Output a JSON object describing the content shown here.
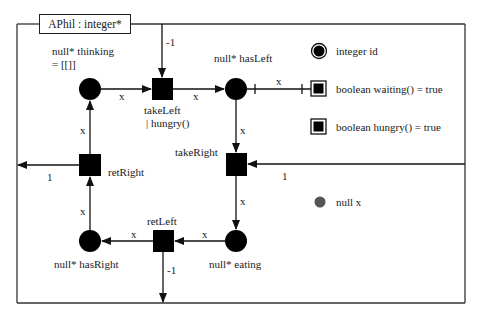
{
  "diagram": {
    "title": "APhil : integer*",
    "places": {
      "thinking": {
        "label": "null*  thinking",
        "marking": "= [[]]"
      },
      "hasLeft": {
        "label": "null*  hasLeft"
      },
      "eating": {
        "label": "null*  eating"
      },
      "hasRight": {
        "label": "null*  hasRight"
      }
    },
    "transitions": {
      "takeLeft": {
        "label": "takeLeft",
        "guard": "| hungry()"
      },
      "takeRight": {
        "label": "takeRight"
      },
      "retLeft": {
        "label": "retLeft"
      },
      "retRight": {
        "label": "retRight"
      }
    },
    "arcs": {
      "thinking_takeLeft": "x",
      "takeLeft_hasLeft": "x",
      "hasLeft_waiting": "x",
      "hasLeft_takeRight": "x",
      "takeRight_eating": "x",
      "eating_retLeft": "x",
      "retLeft_hasRight": "x",
      "hasRight_retRight": "x",
      "retRight_thinking": "x",
      "top_takeLeft": "-1",
      "right_takeRight": "1",
      "retLeft_bottom": "-1",
      "retRight_left": "1"
    },
    "legend": [
      {
        "icon": "double-circle",
        "text": "integer  id"
      },
      {
        "icon": "double-square",
        "text": "boolean  waiting() = true"
      },
      {
        "icon": "double-square",
        "text": "boolean  hungry() = true"
      },
      {
        "icon": "gray-dot",
        "text": "null x"
      }
    ],
    "colors": {
      "stroke": "#222222",
      "fill": "#000000",
      "token": "#555555"
    }
  }
}
